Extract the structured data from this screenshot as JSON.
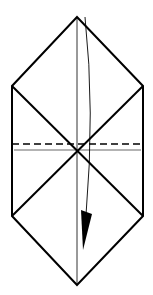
{
  "diagram": {
    "type": "origami-step",
    "colors": {
      "background": "#ffffff",
      "stroke": "#000000"
    },
    "outline": {
      "points": [
        [
          77,
          17
        ],
        [
          143,
          86
        ],
        [
          143,
          216
        ],
        [
          77,
          285
        ],
        [
          12,
          216
        ],
        [
          12,
          86
        ]
      ]
    },
    "diagonals": [
      {
        "from": [
          12,
          86
        ],
        "to": [
          143,
          216
        ]
      },
      {
        "from": [
          143,
          86
        ],
        "to": [
          12,
          216
        ]
      }
    ],
    "center_crease": {
      "from": [
        77,
        17
      ],
      "to": [
        77,
        285
      ]
    },
    "valley_fold_line": {
      "y": 144,
      "x1": 12,
      "x2": 143,
      "style": "dashed"
    },
    "reference_line": {
      "y": 150,
      "x1": 14,
      "x2": 141
    },
    "arrow": {
      "label": "fold-down-arrow",
      "path": "M85 17 Q95 110 86 215",
      "head": [
        [
          81,
          210
        ],
        [
          92,
          214
        ],
        [
          83,
          250
        ]
      ]
    }
  }
}
